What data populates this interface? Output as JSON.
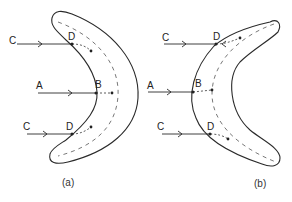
{
  "figure": {
    "panels": [
      {
        "id": "a",
        "caption": "(a)",
        "labels": {
          "ray_top": "C",
          "ray_mid": "A",
          "ray_bottom": "C",
          "entry_top": "D",
          "entry_mid": "B",
          "entry_bottom": "D"
        }
      },
      {
        "id": "b",
        "caption": "(b)",
        "labels": {
          "ray_top": "C",
          "ray_mid": "A",
          "ray_bottom": "C",
          "entry_top": "D",
          "entry_mid": "B",
          "entry_bottom": "D"
        }
      }
    ]
  }
}
